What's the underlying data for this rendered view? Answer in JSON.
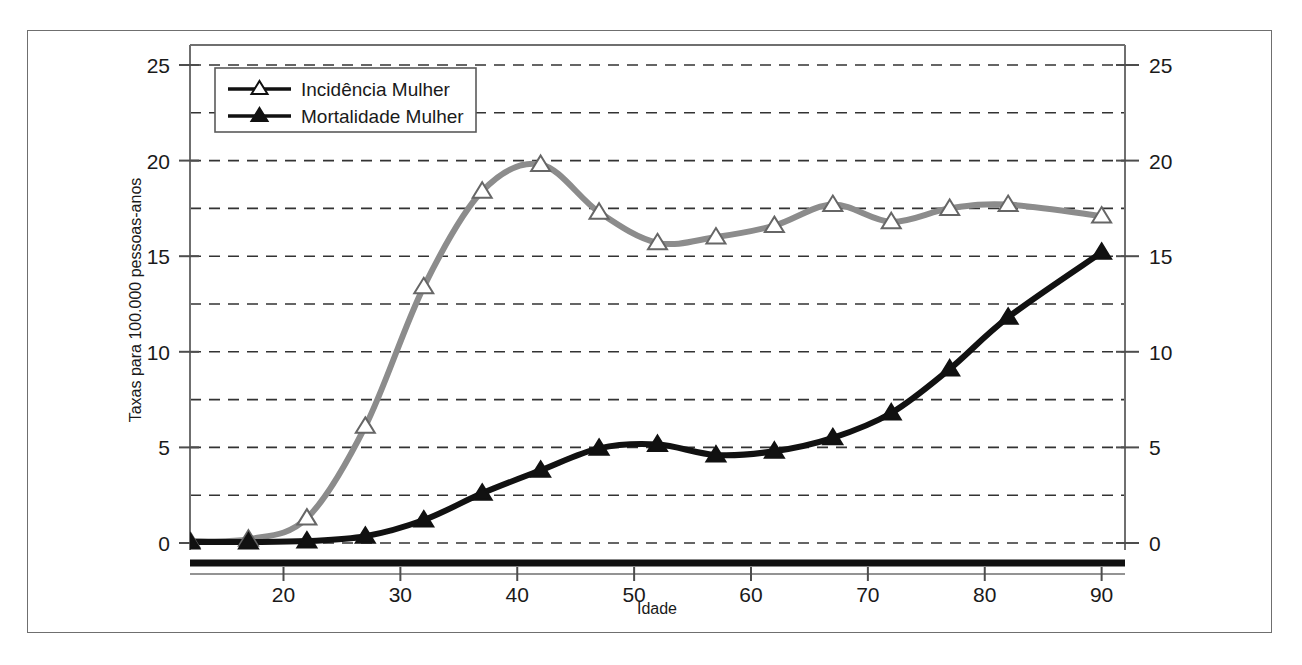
{
  "chart_data": {
    "type": "line",
    "title": "",
    "xlabel": "Idade",
    "ylabel": "Taxas para 100.000 pessoas-anos",
    "ylabel_right": "Taxas para 100.000 pessoas-anos",
    "xlim": [
      12,
      92
    ],
    "ylim": [
      0,
      26
    ],
    "xticks": [
      20,
      30,
      40,
      50,
      60,
      70,
      80,
      90
    ],
    "xtick_labels": [
      "20",
      "30",
      "40",
      "50",
      "60",
      "70",
      "80",
      "90"
    ],
    "yticks": [
      0,
      5,
      10,
      15,
      20,
      25
    ],
    "ytick_labels": [
      "0",
      "5",
      "10",
      "15",
      "20",
      "25"
    ],
    "yticks_right": [
      0,
      5,
      10,
      15,
      20,
      25
    ],
    "ytick_labels_right": [
      "0",
      "5",
      "10",
      "15",
      "20",
      "25"
    ],
    "gridlines_y": [
      0,
      2.5,
      5,
      7.5,
      10,
      12.5,
      15,
      17.5,
      20,
      22.5,
      25
    ],
    "grid": "horizontal-dashed",
    "legend_position": "top-left-inside",
    "x": [
      12,
      17,
      22,
      27,
      32,
      37,
      42,
      47,
      52,
      57,
      62,
      67,
      72,
      77,
      82,
      90
    ],
    "series": [
      {
        "name": "Incidência Mulher",
        "color": "#8c8c8c",
        "marker": "open-triangle",
        "values": [
          0.1,
          0.2,
          1.3,
          6.1,
          13.4,
          18.4,
          19.8,
          17.3,
          15.7,
          16.0,
          16.6,
          17.7,
          16.8,
          17.5,
          17.7,
          17.1
        ]
      },
      {
        "name": "Mortalidade Mulher",
        "color": "#111111",
        "marker": "filled-triangle",
        "values": [
          0.05,
          0.05,
          0.1,
          0.35,
          1.2,
          2.6,
          3.8,
          4.95,
          5.15,
          4.6,
          4.8,
          5.5,
          6.8,
          9.1,
          11.8,
          15.2
        ]
      }
    ]
  },
  "legend": {
    "entries": [
      {
        "label": "Incidência Mulher",
        "marker": "open-triangle"
      },
      {
        "label": "Mortalidade Mulher",
        "marker": "filled-triangle"
      }
    ]
  },
  "axes": {
    "x_title": "Idade",
    "y_title": "Taxas para 100.000 pessoas-anos"
  },
  "colors": {
    "incidence_line": "#8c8c8c",
    "mortality_line": "#111111",
    "axis": "#4d4d4d",
    "grid": "#333333",
    "frame": "#6f6f6f",
    "background": "#ffffff"
  }
}
